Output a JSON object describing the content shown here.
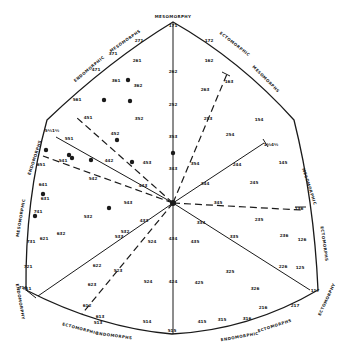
{
  "poles": {
    "top": "MESOMORPHY",
    "left_upper_a": "ENDOMORPHIC",
    "left_upper_b": "MESOMORPHS",
    "right_upper_a": "ECTOMORPHIC",
    "right_upper_b": "MESOMORPHS",
    "left_a": "MESOMORPHIC",
    "left_b": "ENDOMORPHS",
    "right_a": "MESOMORPHIC",
    "right_b": "ECTOMORPHS",
    "left_lower": "ENDOMORPHY",
    "right_lower": "ECTOMORPHY",
    "bottom_left_a": "ECTOMORPHIC",
    "bottom_left_b": "ENDOMORPHS",
    "bottom_right_a": "ENDOMORPHIC",
    "bottom_right_b": "ECTOMORPHS"
  },
  "somatotypes": [
    {
      "code": "171",
      "x": 173,
      "y": 27
    },
    {
      "code": "271",
      "x": 139,
      "y": 42
    },
    {
      "code": "172",
      "x": 209,
      "y": 42
    },
    {
      "code": "371",
      "x": 113,
      "y": 55
    },
    {
      "code": "261",
      "x": 137,
      "y": 62
    },
    {
      "code": "262",
      "x": 173,
      "y": 73
    },
    {
      "code": "162",
      "x": 209,
      "y": 62
    },
    {
      "code": "471",
      "x": 96,
      "y": 71
    },
    {
      "code": "361",
      "x": 116,
      "y": 82
    },
    {
      "code": "362",
      "x": 138,
      "y": 87
    },
    {
      "code": "163",
      "x": 229,
      "y": 83
    },
    {
      "code": "561",
      "x": 77,
      "y": 101
    },
    {
      "code": "252",
      "x": 173,
      "y": 106
    },
    {
      "code": "263",
      "x": 205,
      "y": 91
    },
    {
      "code": "451",
      "x": 88,
      "y": 119
    },
    {
      "code": "352",
      "x": 139,
      "y": 120
    },
    {
      "code": "253",
      "x": 208,
      "y": 120
    },
    {
      "code": "154",
      "x": 259,
      "y": 121
    },
    {
      "code": "5½1½",
      "x": 52,
      "y": 132
    },
    {
      "code": "452",
      "x": 115,
      "y": 135
    },
    {
      "code": "353",
      "x": 173,
      "y": 138
    },
    {
      "code": "254",
      "x": 230,
      "y": 136
    },
    {
      "code": "651",
      "x": 41,
      "y": 166
    },
    {
      "code": "551",
      "x": 69,
      "y": 140
    },
    {
      "code": "541",
      "x": 63,
      "y": 162
    },
    {
      "code": "442",
      "x": 109,
      "y": 162
    },
    {
      "code": "453",
      "x": 147,
      "y": 164
    },
    {
      "code": "343",
      "x": 173,
      "y": 170
    },
    {
      "code": "354",
      "x": 195,
      "y": 165
    },
    {
      "code": "244",
      "x": 237,
      "y": 166
    },
    {
      "code": "1½4½",
      "x": 271,
      "y": 146
    },
    {
      "code": "145",
      "x": 283,
      "y": 164
    },
    {
      "code": "542",
      "x": 93,
      "y": 180
    },
    {
      "code": "443",
      "x": 143,
      "y": 187
    },
    {
      "code": "344",
      "x": 205,
      "y": 185
    },
    {
      "code": "245",
      "x": 254,
      "y": 184
    },
    {
      "code": "641",
      "x": 43,
      "y": 186
    },
    {
      "code": "631",
      "x": 45,
      "y": 200
    },
    {
      "code": "543",
      "x": 128,
      "y": 204
    },
    {
      "code": "345",
      "x": 218,
      "y": 204
    },
    {
      "code": "136",
      "x": 299,
      "y": 210
    },
    {
      "code": "741",
      "x": 38,
      "y": 213
    },
    {
      "code": "532",
      "x": 88,
      "y": 218
    },
    {
      "code": "433",
      "x": 144,
      "y": 222
    },
    {
      "code": "334",
      "x": 201,
      "y": 224
    },
    {
      "code": "235",
      "x": 259,
      "y": 221
    },
    {
      "code": "731",
      "x": 31,
      "y": 243
    },
    {
      "code": "621",
      "x": 44,
      "y": 240
    },
    {
      "code": "632",
      "x": 61,
      "y": 235
    },
    {
      "code": "532b",
      "x": 125,
      "y": 233
    },
    {
      "code": "434",
      "x": 173,
      "y": 240
    },
    {
      "code": "335",
      "x": 234,
      "y": 238
    },
    {
      "code": "236",
      "x": 284,
      "y": 237
    },
    {
      "code": "126",
      "x": 302,
      "y": 241
    },
    {
      "code": "533",
      "x": 119,
      "y": 238
    },
    {
      "code": "524",
      "x": 152,
      "y": 243
    },
    {
      "code": "435",
      "x": 195,
      "y": 243
    },
    {
      "code": "721",
      "x": 28,
      "y": 268
    },
    {
      "code": "622",
      "x": 97,
      "y": 267
    },
    {
      "code": "226",
      "x": 283,
      "y": 268
    },
    {
      "code": "125",
      "x": 300,
      "y": 269
    },
    {
      "code": "623",
      "x": 92,
      "y": 286
    },
    {
      "code": "523",
      "x": 118,
      "y": 272
    },
    {
      "code": "524b",
      "x": 148,
      "y": 283
    },
    {
      "code": "424",
      "x": 173,
      "y": 283
    },
    {
      "code": "425",
      "x": 199,
      "y": 284
    },
    {
      "code": "325",
      "x": 230,
      "y": 273
    },
    {
      "code": "326",
      "x": 255,
      "y": 290
    },
    {
      "code": "711",
      "x": 27,
      "y": 290
    },
    {
      "code": "612",
      "x": 87,
      "y": 307
    },
    {
      "code": "613",
      "x": 100,
      "y": 318
    },
    {
      "code": "514",
      "x": 147,
      "y": 323
    },
    {
      "code": "216",
      "x": 263,
      "y": 309
    },
    {
      "code": "316",
      "x": 247,
      "y": 320
    },
    {
      "code": "415",
      "x": 202,
      "y": 323
    },
    {
      "code": "117",
      "x": 315,
      "y": 292
    },
    {
      "code": "217",
      "x": 295,
      "y": 307
    },
    {
      "code": "513",
      "x": 98,
      "y": 324
    },
    {
      "code": "515",
      "x": 172,
      "y": 332
    },
    {
      "code": "315",
      "x": 222,
      "y": 321
    },
    {
      "code": "711b",
      "x": 23,
      "y": 289
    }
  ],
  "points": [
    {
      "x": 130,
      "y": 101
    },
    {
      "x": 104,
      "y": 100
    },
    {
      "x": 128,
      "y": 80
    },
    {
      "x": 117,
      "y": 140
    },
    {
      "x": 173,
      "y": 153
    },
    {
      "x": 132,
      "y": 162
    },
    {
      "x": 46,
      "y": 150
    },
    {
      "x": 69,
      "y": 155
    },
    {
      "x": 72,
      "y": 158
    },
    {
      "x": 91,
      "y": 160
    },
    {
      "x": 43,
      "y": 194
    },
    {
      "x": 35,
      "y": 216
    },
    {
      "x": 109,
      "y": 208
    }
  ]
}
